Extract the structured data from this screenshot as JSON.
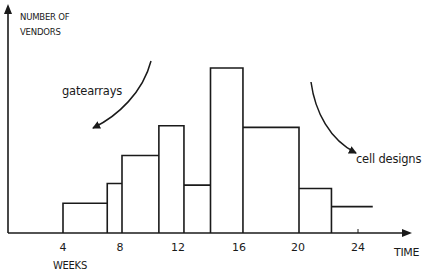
{
  "chart_data": {
    "type": "bar",
    "title": "",
    "xlabel": "TIME",
    "xlabel_units": "WEEKS",
    "ylabel": "NUMBER OF VENDORS",
    "x_ticks": [
      4,
      8,
      12,
      16,
      20,
      24
    ],
    "xlim": [
      0,
      26
    ],
    "ylim": [
      0,
      11
    ],
    "y_ticks": [],
    "grid": false,
    "legend": null,
    "histogram": true,
    "bins": [
      {
        "start": 4.0,
        "end": 7.0,
        "value": 1.8
      },
      {
        "start": 7.0,
        "end": 8.0,
        "value": 3.0
      },
      {
        "start": 8.0,
        "end": 10.5,
        "value": 4.7
      },
      {
        "start": 10.5,
        "end": 12.2,
        "value": 6.5
      },
      {
        "start": 12.2,
        "end": 14.0,
        "value": 2.9
      },
      {
        "start": 14.0,
        "end": 16.2,
        "value": 10.0
      },
      {
        "start": 16.2,
        "end": 20.0,
        "value": 6.4
      },
      {
        "start": 20.0,
        "end": 22.2,
        "value": 2.7
      },
      {
        "start": 22.2,
        "end": 25.0,
        "value": 1.6,
        "open_right": true
      }
    ],
    "annotations": [
      {
        "text": "gatearrays",
        "points_to": "earlier bins (left)",
        "arrow": "curved, pointing down-left"
      },
      {
        "text": "cell designs",
        "points_to": "later bins (right)",
        "arrow": "curved, pointing down-right"
      }
    ]
  },
  "labels": {
    "ylabel_line1": "NUMBER OF",
    "ylabel_line2": "VENDORS",
    "xlabel": "TIME",
    "units": "WEEKS",
    "ticks": [
      "4",
      "8",
      "12",
      "16",
      "20",
      "24"
    ],
    "annot_gate": "gatearrays",
    "annot_cell": "cell designs"
  },
  "style": {
    "ink": "#1a1a1a",
    "background": "#ffffff"
  }
}
